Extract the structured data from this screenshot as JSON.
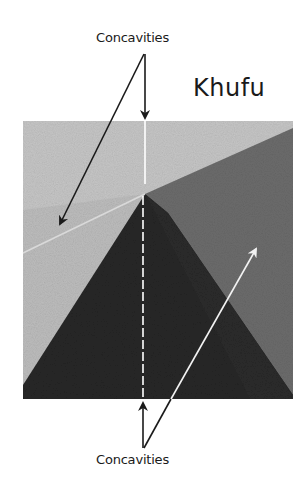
{
  "figure": {
    "title": "Khufu",
    "labels": {
      "top": "Concavities",
      "bottom": "Concavities"
    },
    "colors": {
      "background": "#ffffff",
      "sky_light": "#b9b9b9",
      "face_left": "#c4c4c4",
      "face_right": "#6e6e6e",
      "face_front": "#262626",
      "arrow_dark": "#1a1a1a",
      "arrow_light": "#f2f2f2"
    }
  }
}
